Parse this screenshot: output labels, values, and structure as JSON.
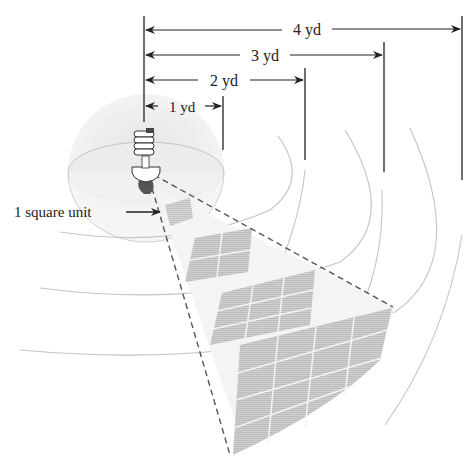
{
  "diagram": {
    "type": "inverse-square-law illustration",
    "distance_labels": [
      {
        "id": "d1",
        "text": "1 yd"
      },
      {
        "id": "d2",
        "text": "2 yd"
      },
      {
        "id": "d3",
        "text": "3 yd"
      },
      {
        "id": "d4",
        "text": "4 yd"
      }
    ],
    "area_label": "1 square unit",
    "source": "compact-fluorescent-bulb",
    "patches": [
      {
        "distance": "1 yd",
        "grid": "1x1"
      },
      {
        "distance": "2 yd",
        "grid": "2x2"
      },
      {
        "distance": "3 yd",
        "grid": "3x3"
      },
      {
        "distance": "4 yd",
        "grid": "4x4"
      }
    ],
    "colors": {
      "line": "#222222",
      "sphere": "#bdbdbd",
      "patch": "#c8c8c8",
      "dashed": "#555555"
    }
  }
}
